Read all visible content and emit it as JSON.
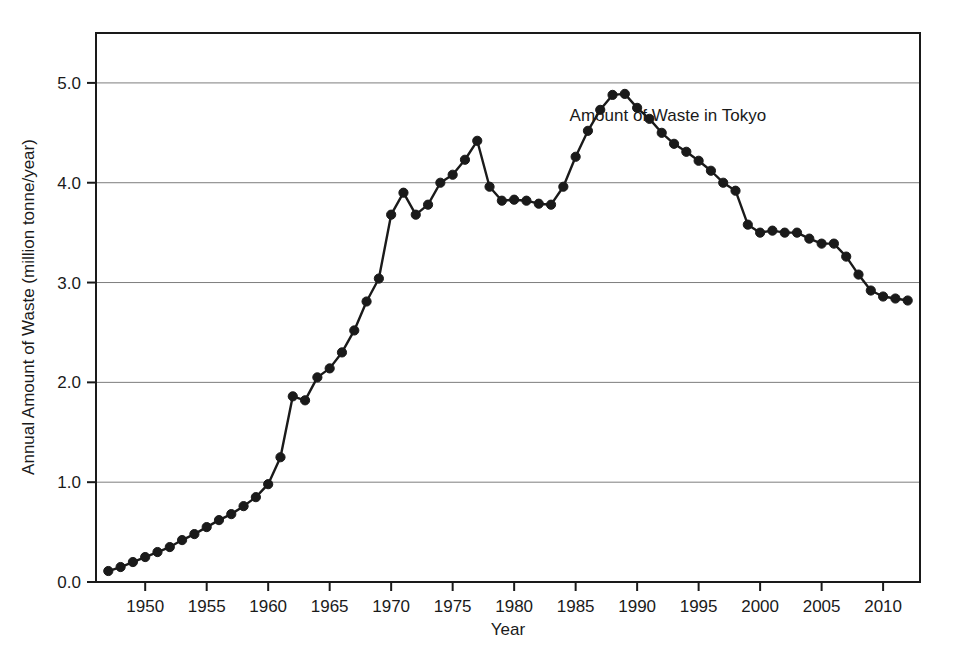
{
  "chart_data": {
    "type": "line",
    "title": "",
    "xlabel": "Year",
    "ylabel": "Annual Amount of Waste (million tonne/year)",
    "xlim": [
      1946,
      2013
    ],
    "ylim": [
      0.0,
      5.5
    ],
    "xticks": [
      1950,
      1955,
      1960,
      1965,
      1970,
      1975,
      1980,
      1985,
      1990,
      1995,
      2000,
      2005,
      2010
    ],
    "xtick_labels": [
      "1950",
      "1955",
      "1960",
      "1965",
      "1970",
      "1975",
      "1980",
      "1985",
      "1990",
      "1995",
      "2000",
      "2005",
      "2010"
    ],
    "yticks": [
      0.0,
      1.0,
      2.0,
      3.0,
      4.0,
      5.0
    ],
    "ytick_labels": [
      "0.0",
      "1.0",
      "2.0",
      "3.0",
      "4.0",
      "5.0"
    ],
    "grid": "horizontal",
    "legend_position": "none",
    "annotations": [
      {
        "text": "Amount of Waste in Tokyo",
        "x": 1992.5,
        "y": 4.62
      }
    ],
    "series": [
      {
        "name": "Amount of Waste in Tokyo",
        "color": "#1a1a1a",
        "marker": "circle",
        "x": [
          1947,
          1948,
          1949,
          1950,
          1951,
          1952,
          1953,
          1954,
          1955,
          1956,
          1957,
          1958,
          1959,
          1960,
          1961,
          1962,
          1963,
          1964,
          1965,
          1966,
          1967,
          1968,
          1969,
          1970,
          1971,
          1972,
          1973,
          1974,
          1975,
          1976,
          1977,
          1978,
          1979,
          1980,
          1981,
          1982,
          1983,
          1984,
          1985,
          1986,
          1987,
          1988,
          1989,
          1990,
          1991,
          1992,
          1993,
          1994,
          1995,
          1996,
          1997,
          1998,
          1999,
          2000,
          2001,
          2002,
          2003,
          2004,
          2005,
          2006,
          2007,
          2008,
          2009,
          2010,
          2011,
          2012
        ],
        "y": [
          0.11,
          0.15,
          0.2,
          0.25,
          0.3,
          0.35,
          0.42,
          0.48,
          0.55,
          0.62,
          0.68,
          0.76,
          0.85,
          0.98,
          1.25,
          1.86,
          1.82,
          2.05,
          2.14,
          2.3,
          2.52,
          2.81,
          3.04,
          3.68,
          3.9,
          3.68,
          3.78,
          4.0,
          4.08,
          4.23,
          4.42,
          3.96,
          3.82,
          3.83,
          3.82,
          3.79,
          3.78,
          3.96,
          4.26,
          4.52,
          4.73,
          4.88,
          4.89,
          4.75,
          4.64,
          4.5,
          4.39,
          4.31,
          4.22,
          4.12,
          4.0,
          3.92,
          3.58,
          3.5,
          3.52,
          3.5,
          3.5,
          3.44,
          3.39,
          3.39,
          3.26,
          3.08,
          2.92,
          2.86,
          2.84,
          2.82
        ]
      }
    ]
  },
  "axis": {
    "x_title": "Year",
    "y_title": "Annual Amount of Waste (million tonne/year)"
  }
}
